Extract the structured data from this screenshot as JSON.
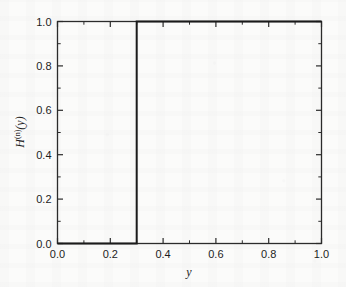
{
  "figure": {
    "background_color": "#fbfbfa",
    "frame_color": "#2b2b2b",
    "line_color": "#1a1a1a"
  },
  "axis": {
    "x_title": "y",
    "y_title_base": "H",
    "y_title_superscript": "(n)",
    "y_title_arg": "(y)",
    "x_ticklabels": [
      "0.0",
      "0.2",
      "0.4",
      "0.6",
      "0.8",
      "1.0"
    ],
    "y_ticklabels": [
      "0.0",
      "0.2",
      "0.4",
      "0.6",
      "0.8",
      "1.0"
    ]
  },
  "chart_data": {
    "type": "line",
    "title": "",
    "subtitle": "",
    "xlabel": "y",
    "ylabel": "H^(n)(y)",
    "xlim": [
      0.0,
      1.0
    ],
    "ylim": [
      0.0,
      1.0
    ],
    "xticks": [
      0.0,
      0.2,
      0.4,
      0.6,
      0.8,
      1.0
    ],
    "yticks": [
      0.0,
      0.2,
      0.4,
      0.6,
      0.8,
      1.0
    ],
    "x_minor_ticks": [
      0.1,
      0.3,
      0.5,
      0.7,
      0.9
    ],
    "y_minor_ticks": [
      0.1,
      0.3,
      0.5,
      0.7,
      0.9
    ],
    "grid": false,
    "legend": null,
    "tick_direction": "in",
    "step_location": 0.3,
    "series": [
      {
        "name": "H^(n)(y)",
        "color": "#1a1a1a",
        "linewidth": 2,
        "x": [
          0.0,
          0.3,
          0.3,
          1.0
        ],
        "values": [
          0.0,
          0.0,
          1.0,
          1.0
        ]
      }
    ]
  }
}
